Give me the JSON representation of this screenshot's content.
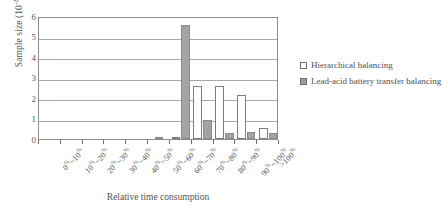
{
  "chart_data": {
    "type": "bar",
    "title": "",
    "xlabel": "Relative time consumption",
    "ylabel": "Sample size (10",
    "ylabel_exponent": "-28",
    "ylabel_suffix": ")",
    "ylim": [
      0,
      6
    ],
    "yticks": [
      6,
      5,
      4,
      3,
      2,
      1,
      0
    ],
    "grid": true,
    "legend_position": "right",
    "categories": [
      "0%~10%",
      "10%~20%",
      "20%~30%",
      "30%~40%",
      "40%~50%",
      "50%~60%",
      "60%~70%",
      "70%~80%",
      "80%~90%",
      "90%~100%",
      ">100%"
    ],
    "series": [
      {
        "name": "Hierarchical balancing",
        "color": "#ffffff",
        "values": [
          0,
          0,
          0,
          0,
          0,
          0,
          0.12,
          2.6,
          2.6,
          2.15,
          0.55
        ]
      },
      {
        "name": "Lead-acid battery transfer balancing",
        "color": "#a3a3a3",
        "values": [
          0,
          0,
          0,
          0,
          0,
          0.05,
          5.55,
          0.95,
          0.28,
          0.33,
          0.3
        ]
      }
    ]
  },
  "legend": {
    "items": [
      {
        "label": "Hierarchical balancing",
        "swatch": "hier"
      },
      {
        "label": "Lead-acid battery transfer balancing",
        "swatch": "lead"
      }
    ]
  }
}
